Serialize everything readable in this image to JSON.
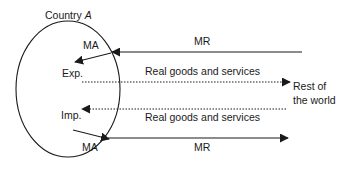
{
  "diagram": {
    "country": {
      "label_prefix": "Country ",
      "label_var": "A"
    },
    "labels": {
      "ma_top": "MA",
      "exp": "Exp.",
      "imp": "Imp.",
      "ma_bottom": "MA",
      "mr_top": "MR",
      "mr_bottom": "MR",
      "goods_top": "Real goods and services",
      "goods_bottom": "Real goods and services",
      "rest_line1": "Rest of",
      "rest_line2": "the world"
    },
    "flows": [
      {
        "name": "MR inflow",
        "from": "Rest of the world",
        "to": "Country A",
        "style": "solid"
      },
      {
        "name": "MA to Exp.",
        "from": "boundary",
        "to": "Exp.",
        "style": "solid"
      },
      {
        "name": "Exports",
        "from": "Exp.",
        "to": "Rest of the world",
        "style": "dotted",
        "label": "Real goods and services"
      },
      {
        "name": "Imports",
        "from": "Rest of the world",
        "to": "Imp.",
        "style": "dotted",
        "label": "Real goods and services"
      },
      {
        "name": "Imp. to MA",
        "from": "Imp.",
        "to": "boundary",
        "style": "solid"
      },
      {
        "name": "MR outflow",
        "from": "Country A",
        "to": "Rest of the world",
        "style": "solid"
      }
    ],
    "colors": {
      "stroke": "#1a1a1a",
      "background": "#ffffff"
    }
  }
}
